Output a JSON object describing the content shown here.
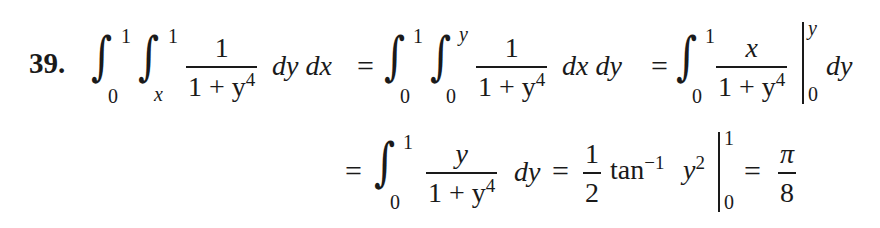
{
  "problem": {
    "number": "39.",
    "line1": {
      "int1": {
        "symbol": "∫",
        "lower": "0",
        "upper": "1"
      },
      "int2": {
        "symbol": "∫",
        "lower": "x",
        "upper": "1"
      },
      "frac1": {
        "num": "1",
        "den_base": "1 + y",
        "den_exp": "4"
      },
      "diff1": "dy dx",
      "eq1": "=",
      "int3": {
        "symbol": "∫",
        "lower": "0",
        "upper": "1"
      },
      "int4": {
        "symbol": "∫",
        "lower": "0",
        "upper": "y"
      },
      "frac2": {
        "num": "1",
        "den_base": "1 + y",
        "den_exp": "4"
      },
      "diff2": "dx dy",
      "eq2": "=",
      "int5": {
        "symbol": "∫",
        "lower": "0",
        "upper": "1"
      },
      "frac3": {
        "num": "x",
        "den_base": "1 + y",
        "den_exp": "4"
      },
      "eval": {
        "lower": "0",
        "upper": "y"
      },
      "diff3": "dy"
    },
    "line2": {
      "eq1": "=",
      "int1": {
        "symbol": "∫",
        "lower": "0",
        "upper": "1"
      },
      "frac1": {
        "num": "y",
        "den_base": "1 + y",
        "den_exp": "4"
      },
      "diff1": "dy",
      "eq2": "=",
      "half": {
        "num": "1",
        "den": "2"
      },
      "func": "tan",
      "func_exp": "−1",
      "arg_base": "y",
      "arg_exp": "2",
      "eval": {
        "lower": "0",
        "upper": "1"
      },
      "eq3": "=",
      "result": {
        "num": "π",
        "den": "8"
      }
    }
  }
}
